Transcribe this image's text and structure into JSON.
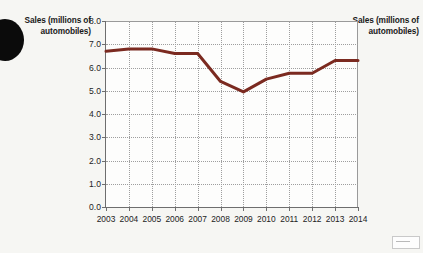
{
  "labels": {
    "left_caption": "Sales\n(millions of\nautomobiles)",
    "right_caption": "Sales\n(millions of\nautomobiles)"
  },
  "colors": {
    "line": "#7B2A20",
    "axis": "#6e6e6e",
    "grid": "#9e9e9e",
    "plot_background": "#fdfdfc",
    "page_background": "#f6f6f3"
  },
  "chart_data": {
    "type": "line",
    "title": "",
    "xlabel": "",
    "ylabel": "Sales (millions of automobiles)",
    "categories": [
      "2003",
      "2004",
      "2005",
      "2006",
      "2007",
      "2008",
      "2009",
      "2010",
      "2011",
      "2012",
      "2013",
      "2014"
    ],
    "values": [
      6.7,
      6.8,
      6.8,
      6.6,
      6.6,
      5.4,
      4.95,
      5.5,
      5.75,
      5.75,
      6.3,
      6.3
    ],
    "series": [
      {
        "name": "Sales (millions of automobiles)",
        "values": [
          6.7,
          6.8,
          6.8,
          6.6,
          6.6,
          5.4,
          4.95,
          5.5,
          5.75,
          5.75,
          6.3,
          6.3
        ],
        "color": "#7B2A20"
      }
    ],
    "ylim": [
      0.0,
      8.0
    ],
    "ytick_step": 1.0,
    "ytick_labels": [
      "0.0",
      "1.0",
      "2.0",
      "3.0",
      "4.0",
      "5.0",
      "6.0",
      "7.0",
      "8.0"
    ],
    "xtick_labels": [
      "2003",
      "2004",
      "2005",
      "2006",
      "2007",
      "2008",
      "2009",
      "2010",
      "2011",
      "2012",
      "2013",
      "2014"
    ],
    "grid": true,
    "grid_style": "dotted",
    "legend": false,
    "legend_position": "none",
    "line_width_px": 3
  }
}
